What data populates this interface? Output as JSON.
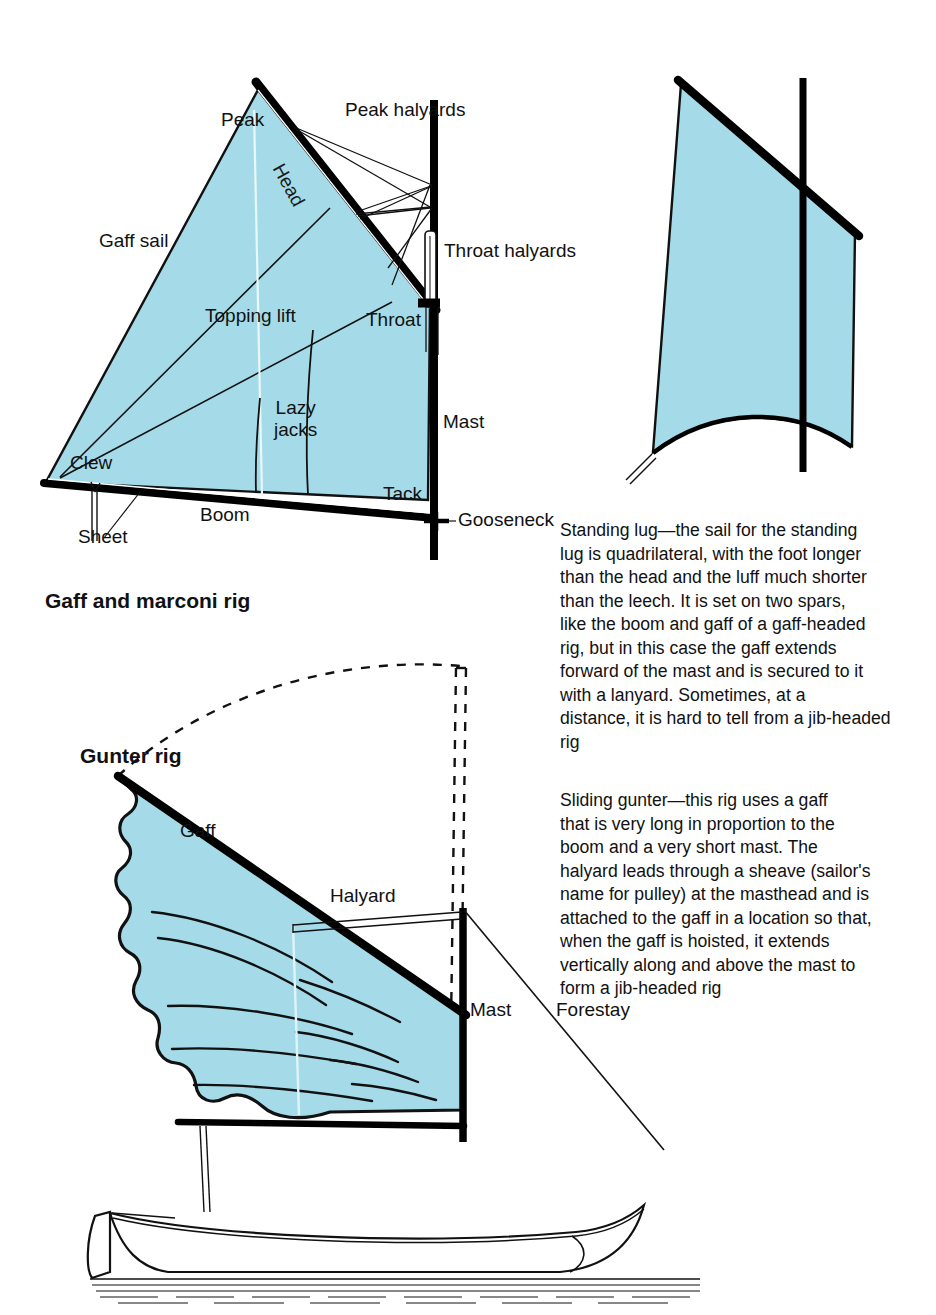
{
  "page": {
    "width": 936,
    "height": 1315,
    "background": "#ffffff"
  },
  "colors": {
    "sail_fill": "#a5dbe8",
    "spar_black": "#000000",
    "line_black": "#1a1a1a",
    "text": "#111111",
    "hull_white": "#ffffff"
  },
  "figures": {
    "gaff_rig": {
      "caption": "Gaff and marconi rig",
      "labels": {
        "peak": "Peak",
        "peak_halyards": "Peak halyards",
        "head": "Head",
        "gaff_sail": "Gaff sail",
        "throat_halyards": "Throat halyards",
        "topping_lift": "Topping lift",
        "throat": "Throat",
        "lazy_jacks": "Lazy\njacks",
        "mast": "Mast",
        "clew": "Clew",
        "tack": "Tack",
        "boom": "Boom",
        "sheet": "Sheet",
        "gooseneck": "Gooseneck"
      }
    },
    "standing_lug": {
      "description": "Standing lug—the sail for the standing\nlug is quadrilateral, with the foot longer\nthan the head and the luff much shorter\nthan the leech. It is set on two spars,\nlike the boom and gaff of a gaff-headed\nrig, but in this case the gaff extends\nforward of the mast and is secured to it\nwith a lanyard. Sometimes, at a\ndistance, it is hard to tell from a jib-headed\nrig"
    },
    "gunter_rig": {
      "title": "Gunter rig",
      "description": "Sliding gunter—this rig uses a gaff\nthat is very long in proportion to the\nboom and a very short mast. The\nhalyard leads through a sheave (sailor's\nname for pulley) at the masthead and is\nattached to the gaff in a location so that,\nwhen the gaff is hoisted, it extends\nvertically along and above the mast to\nform a jib-headed rig",
      "labels": {
        "gaff": "Gaff",
        "halyard": "Halyard",
        "mast": "Mast",
        "forestay": "Forestay"
      }
    }
  }
}
